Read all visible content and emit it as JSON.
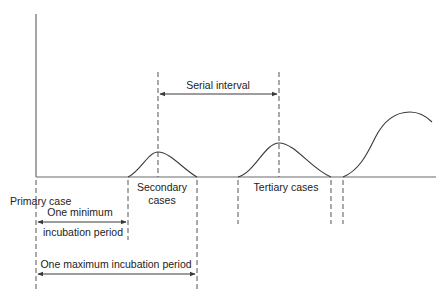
{
  "diagram": {
    "title": "",
    "colors": {
      "line": "#3a3a3a",
      "dash": "#555555",
      "text": "#222222",
      "background": "#ffffff"
    },
    "labels": {
      "serial_interval": "Serial interval",
      "primary_case": "Primary case",
      "secondary_cases_line1": "Secondary",
      "secondary_cases_line2": "cases",
      "tertiary_cases": "Tertiary cases",
      "min_incubation_line1": "One minimum",
      "min_incubation_line2": "incubation period",
      "max_incubation": "One maximum incubation period"
    },
    "curves": [
      {
        "name": "secondary-cases",
        "start_x": 128,
        "peak_x": 158,
        "end_x": 197
      },
      {
        "name": "tertiary-cases",
        "start_x": 238,
        "peak_x": 279,
        "end_x": 331
      },
      {
        "name": "next-generation",
        "start_x": 343,
        "peak_x": 410,
        "end_x": 432
      }
    ],
    "intervals": [
      {
        "name": "serial-interval",
        "from": "secondary peak",
        "to": "tertiary peak"
      },
      {
        "name": "minimum-incubation",
        "from": "primary case",
        "to": "secondary start"
      },
      {
        "name": "maximum-incubation",
        "from": "primary case",
        "to": "secondary end"
      }
    ]
  }
}
